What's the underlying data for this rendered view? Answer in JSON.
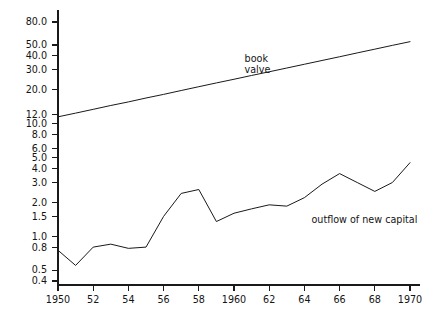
{
  "chart_data": {
    "type": "line",
    "title": "",
    "subtitle": "",
    "xlabel": "",
    "ylabel": "",
    "yscale": "log",
    "xscale": "linear",
    "grid": false,
    "legend_position": "inline-annotation",
    "xlim": [
      1950,
      1970
    ],
    "ylim": [
      0.4,
      90
    ],
    "x": [
      1950,
      1951,
      1952,
      1953,
      1954,
      1955,
      1956,
      1957,
      1958,
      1959,
      1960,
      1961,
      1962,
      1963,
      1964,
      1965,
      1966,
      1967,
      1968,
      1969,
      1970
    ],
    "xtick_values": [
      1950,
      1952,
      1954,
      1956,
      1958,
      1960,
      1962,
      1964,
      1966,
      1968,
      1970
    ],
    "xtick_labels": [
      "1950",
      "52",
      "54",
      "56",
      "58",
      "1960",
      "62",
      "64",
      "66",
      "68",
      "1970"
    ],
    "ytick_values": [
      0.4,
      0.5,
      0.8,
      1.0,
      1.5,
      2.0,
      3.0,
      4.0,
      5.0,
      6.0,
      8.0,
      10.0,
      12.0,
      20.0,
      30.0,
      40.0,
      50.0,
      80.0
    ],
    "ytick_labels": [
      "0.4",
      "0.5",
      "0.8",
      "1.0",
      "1.5",
      "2.0",
      "3.0",
      "4.0",
      "5.0",
      "6.0",
      "8.0",
      "10.0",
      "12.0",
      "20.0",
      "30.0",
      "40.0",
      "50.0",
      "80.0"
    ],
    "series": [
      {
        "name": "book valve",
        "label_line_1": "book",
        "label_line_2": "valve",
        "label_x": 1960.6,
        "label_y_1": 35.0,
        "label_y_2": 28.0,
        "color": "#1a1a1a",
        "values": [
          11.5,
          12.4,
          13.4,
          14.5,
          15.6,
          16.9,
          18.2,
          19.7,
          21.3,
          23.0,
          24.8,
          26.8,
          28.9,
          31.2,
          33.7,
          36.4,
          39.3,
          42.5,
          45.9,
          49.6,
          53.5
        ]
      },
      {
        "name": "outflow of new capital",
        "label_line_1": "outflow of new capital",
        "label_x": 1964.4,
        "label_y_1": 1.32,
        "color": "#1a1a1a",
        "values": [
          0.75,
          0.55,
          0.8,
          0.85,
          0.78,
          0.8,
          1.5,
          2.4,
          2.6,
          1.35,
          1.6,
          1.75,
          1.9,
          1.85,
          2.2,
          2.9,
          3.6,
          3.0,
          2.5,
          3.0,
          4.5
        ]
      }
    ]
  },
  "figure": {
    "background_color": "#ffffff",
    "axis_color": "#1a1a1a"
  }
}
